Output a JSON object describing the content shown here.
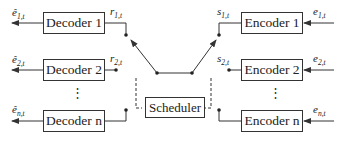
{
  "decoders": [
    {
      "label": "Decoder 1",
      "output_hat": "ê",
      "output_sub": "1,t",
      "input_var": "r",
      "input_sub": "1,t"
    },
    {
      "label": "Decoder 2",
      "output_hat": "ê",
      "output_sub": "2,t",
      "input_var": "r",
      "input_sub": "2,t"
    },
    {
      "label": "Decoder n",
      "output_hat": "ê",
      "output_sub": "n,t"
    }
  ],
  "encoders": [
    {
      "label": "Encoder 1",
      "input_var": "e",
      "input_sub": "1,t",
      "output_var": "s",
      "output_sub": "1,t"
    },
    {
      "label": "Encoder 2",
      "input_var": "e",
      "input_sub": "2,t",
      "output_var": "s",
      "output_sub": "2,t"
    },
    {
      "label": "Encoder n",
      "input_var": "e",
      "input_sub": "n,t"
    }
  ],
  "scheduler": {
    "label": "Scheduler"
  },
  "ellipsis": "⋮",
  "colors": {
    "stroke": "#333333",
    "background": "#ffffff"
  }
}
